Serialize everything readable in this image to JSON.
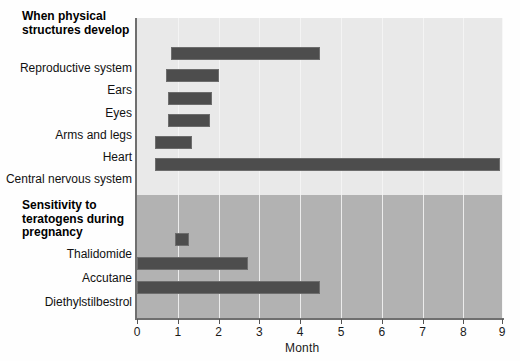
{
  "chart_data": {
    "type": "bar",
    "orientation": "horizontal",
    "title": "",
    "xlabel": "Month",
    "ylabel": "",
    "xlim": [
      0,
      8.9
    ],
    "xticks": [
      "0",
      "1",
      "2",
      "3",
      "4",
      "5",
      "6",
      "7",
      "8",
      "9"
    ],
    "grid": true,
    "legend": "none",
    "sections": [
      {
        "heading": "When physical\nstructures develop",
        "background": "#e9e9e9",
        "bars": [
          {
            "label": "Reproductive system",
            "start": 0.83,
            "end": 4.48
          },
          {
            "label": "Ears",
            "start": 0.71,
            "end": 2.0
          },
          {
            "label": "Eyes",
            "start": 0.76,
            "end": 1.85
          },
          {
            "label": "Arms and legs",
            "start": 0.76,
            "end": 1.78
          },
          {
            "label": "Heart",
            "start": 0.44,
            "end": 1.34
          },
          {
            "label": "Central nervous system",
            "start": 0.44,
            "end": 8.9
          }
        ]
      },
      {
        "heading": "Sensitivity to\nteratogens during\npregnancy",
        "background": "#b2b2b2",
        "bars": [
          {
            "label": "Thalidomide",
            "start": 0.93,
            "end": 1.27
          },
          {
            "label": "Accutane",
            "start": 0.0,
            "end": 2.71
          },
          {
            "label": "Diethylstilbestrol",
            "start": 0.0,
            "end": 4.49
          }
        ]
      }
    ]
  },
  "sections": {
    "structures": {
      "heading": "When physical\nstructures develop"
    },
    "sensitivity": {
      "heading": "Sensitivity to\nteratogens during\npregnancy"
    }
  },
  "labels": {
    "reproductive_system": "Reproductive system",
    "ears": "Ears",
    "eyes": "Eyes",
    "arms_and_legs": "Arms and legs",
    "heart": "Heart",
    "central_nervous_system": "Central nervous system",
    "thalidomide": "Thalidomide",
    "accutane": "Accutane",
    "diethylstilbestrol": "Diethylstilbestrol"
  },
  "axis": {
    "title": "Month",
    "ticks": [
      "0",
      "1",
      "2",
      "3",
      "4",
      "5",
      "6",
      "7",
      "8",
      "9"
    ]
  },
  "colors": {
    "bar": "#4d4d4d",
    "band_structures": "#e9e9e9",
    "band_sensitivity": "#b2b2b2",
    "axis": "#6f6f6f",
    "gridline": "#f6f6f6"
  }
}
